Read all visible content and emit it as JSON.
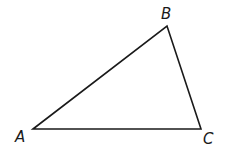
{
  "figure": {
    "type": "triangle",
    "stroke_color": "#1a1a1a",
    "fill_color": "#ffffff",
    "vertices": [
      {
        "name": "A",
        "label": "A",
        "x": 33,
        "y": 129,
        "label_x": 15,
        "label_y": 130
      },
      {
        "name": "B",
        "label": "B",
        "x": 167,
        "y": 26,
        "label_x": 161,
        "label_y": 7
      },
      {
        "name": "C",
        "label": "C",
        "x": 201,
        "y": 129,
        "label_x": 203,
        "label_y": 132
      }
    ],
    "sides": [
      {
        "name": "AB",
        "from": "A",
        "to": "B"
      },
      {
        "name": "BC",
        "from": "B",
        "to": "C"
      },
      {
        "name": "CA",
        "from": "C",
        "to": "A"
      }
    ]
  }
}
